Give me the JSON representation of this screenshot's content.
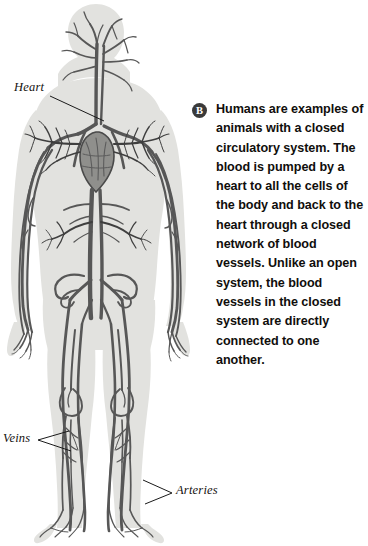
{
  "figure": {
    "labels": [
      {
        "name": "heart",
        "text": "Heart"
      },
      {
        "name": "veins",
        "text": "Veins"
      },
      {
        "name": "arteries",
        "text": "Arteries"
      }
    ],
    "colors": {
      "body_silhouette": "#e2e2df",
      "body_shadow": "#d2d2cf",
      "vessel": "#575757",
      "vessel_dark": "#3f3f3f",
      "leader_line": "#1a1a1a",
      "background": "#ffffff"
    }
  },
  "panel": {
    "badge": {
      "letter": "B",
      "icon": "circled-letter-b-icon",
      "color": "#3a3a3a"
    },
    "body_text": "Humans are examples of animals with a closed circulatory system. The blood is pumped by a heart to all the cells of the body and back to the heart through a closed network of blood vessels. Unlike an open system, the blood vessels in the closed system are directly connected to one another."
  }
}
